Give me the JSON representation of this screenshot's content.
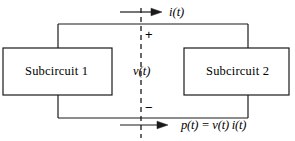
{
  "diagram": {
    "type": "circuit-schematic",
    "stroke_color": "#1a1a1a",
    "background_color": "#ffffff",
    "blocks": [
      {
        "id": "subcircuit-1",
        "label": "Subcircuit 1"
      },
      {
        "id": "subcircuit-2",
        "label": "Subcircuit 2"
      }
    ],
    "labels": {
      "current": "i(t)",
      "voltage": "v(t)",
      "power_equation": "p(t) = v(t) i(t)",
      "polarity_plus": "+",
      "polarity_minus": "−"
    },
    "annotations": {
      "interface_line_style": "dashed",
      "top_arrow_direction": "right",
      "bottom_arrow_direction": "right"
    }
  }
}
